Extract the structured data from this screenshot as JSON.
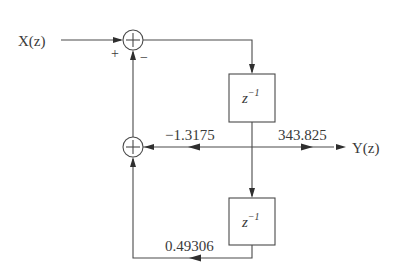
{
  "diagram": {
    "type": "signal-flow block diagram (second-order IIR section)",
    "input": {
      "label": "X(z)"
    },
    "output": {
      "label": "Y(z)"
    },
    "adders": [
      {
        "id": "adder-top",
        "signs": {
          "left": "+",
          "bottom": "−"
        }
      },
      {
        "id": "adder-bottom"
      }
    ],
    "delays": [
      {
        "id": "delay-1",
        "label": "z",
        "exponent": "−1"
      },
      {
        "id": "delay-2",
        "label": "z",
        "exponent": "−1"
      }
    ],
    "gains": [
      {
        "id": "gain-feedback-1",
        "value": "−1.3175"
      },
      {
        "id": "gain-forward",
        "value": "343.825"
      },
      {
        "id": "gain-feedback-2",
        "value": "0.49306"
      }
    ]
  }
}
